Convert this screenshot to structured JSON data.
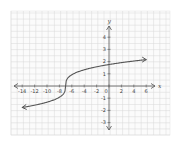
{
  "chart_data": {
    "type": "line",
    "title": "",
    "xlabel": "x",
    "ylabel": "y",
    "xlim": [
      -15,
      7
    ],
    "ylim": [
      -3.5,
      4.5
    ],
    "grid": true,
    "x_ticks": [
      -14,
      -12,
      -10,
      -8,
      -6,
      -4,
      -2,
      0,
      2,
      4,
      6
    ],
    "x_tick_labels": [
      "-14",
      "-12",
      "-10",
      "-8",
      "-6",
      "-4",
      "-2",
      "0",
      "2",
      "4",
      "6"
    ],
    "y_ticks": [
      -3,
      -2,
      -1,
      1,
      2,
      3,
      4
    ],
    "y_tick_labels": [
      "-3",
      "-2",
      "-1",
      "1",
      "2",
      "3",
      "4"
    ],
    "series": [
      {
        "name": "cube-root-like curve",
        "description": "y = 0.9*cbrt(x+7) shape, inflection near (-7, 0), arrows at both ends",
        "x": [
          -14,
          -12,
          -10,
          -8,
          -7.5,
          -7,
          -6.5,
          -6,
          -4,
          -2,
          0,
          2,
          4,
          6
        ],
        "y": [
          -2.0,
          -1.6,
          -1.3,
          -0.8,
          -0.5,
          0.0,
          0.6,
          0.9,
          1.4,
          1.7,
          2.0,
          2.1,
          2.3,
          2.4
        ],
        "arrows": [
          "start",
          "end"
        ],
        "color": "#555555"
      }
    ],
    "colors": {
      "curve": "#555555",
      "axis": "#555555",
      "grid": "#d8d8d8",
      "background": "#ffffff"
    }
  }
}
